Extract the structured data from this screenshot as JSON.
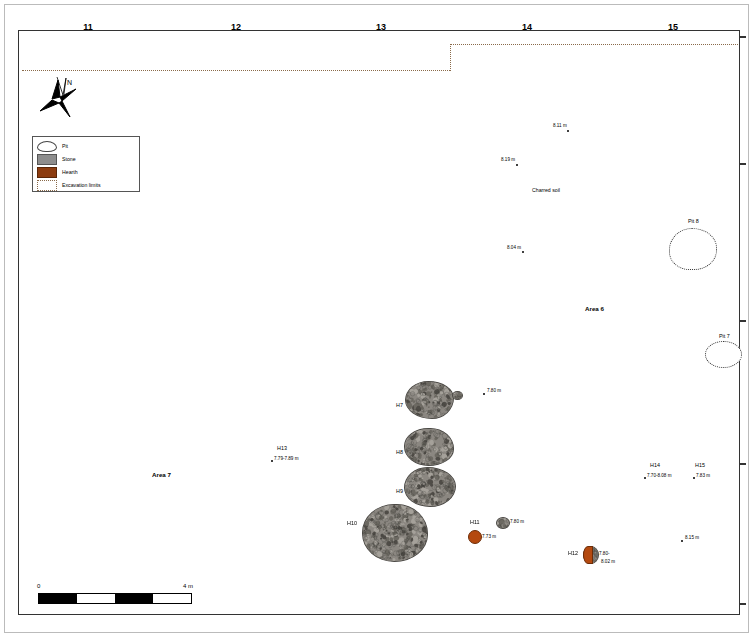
{
  "grid_labels": [
    {
      "label": "11",
      "x": 88
    },
    {
      "label": "12",
      "x": 236
    },
    {
      "label": "13",
      "x": 381
    },
    {
      "label": "14",
      "x": 527
    },
    {
      "label": "15",
      "x": 673
    }
  ],
  "legend": {
    "items": [
      {
        "key": "pit",
        "label": "Pit"
      },
      {
        "key": "stone",
        "label": "Stone"
      },
      {
        "key": "hearth",
        "label": "Hearth"
      },
      {
        "key": "excavation-limits",
        "label": "Excavation limits"
      }
    ]
  },
  "north_arrow": {
    "label": "N"
  },
  "areas": [
    {
      "label": "Area 6",
      "x": 585,
      "y": 308
    },
    {
      "label": "Area 7",
      "x": 152,
      "y": 474
    }
  ],
  "annotations": [
    {
      "label": "Charred soil",
      "x": 532,
      "y": 190
    }
  ],
  "features": [
    {
      "name": "H7",
      "label": "H7",
      "lx": 396,
      "ly": 404
    },
    {
      "name": "H8",
      "label": "H8",
      "lx": 396,
      "ly": 451
    },
    {
      "name": "H9",
      "label": "H9",
      "lx": 396,
      "ly": 490
    },
    {
      "name": "H10",
      "label": "H10",
      "lx": 348,
      "ly": 522
    },
    {
      "name": "H11",
      "label": "H11",
      "lx": 470,
      "ly": 521
    },
    {
      "name": "H12",
      "label": "H12",
      "lx": 570,
      "ly": 552
    },
    {
      "name": "H13",
      "label": "H13",
      "lx": 277,
      "ly": 447
    },
    {
      "name": "H14",
      "label": "H14",
      "lx": 650,
      "ly": 464
    },
    {
      "name": "H15",
      "label": "H15",
      "lx": 695,
      "ly": 464
    },
    {
      "name": "Pit 8",
      "label": "Pit 8",
      "lx": 688,
      "ly": 221
    },
    {
      "name": "Pit 7",
      "label": "Pit 7",
      "lx": 719,
      "ly": 336
    }
  ],
  "elevations": [
    {
      "value": "8.11 m",
      "x": 553,
      "y": 126,
      "dx": 567,
      "dy": 130
    },
    {
      "value": "8.19 m",
      "x": 501,
      "y": 160,
      "dx": 516,
      "dy": 164
    },
    {
      "value": "8.04 m",
      "x": 507,
      "y": 248,
      "dx": 522,
      "dy": 251
    },
    {
      "value": "7.80 m",
      "x": 485,
      "y": 390,
      "dx": 482,
      "dy": 394
    },
    {
      "value": "7.79-7.89 m",
      "x": 272,
      "y": 457,
      "dx": 270,
      "dy": 460
    },
    {
      "value": "7.70-8.08 m",
      "x": 645,
      "y": 474,
      "dx": 643,
      "dy": 478
    },
    {
      "value": "7.83 m",
      "x": 694,
      "y": 474,
      "dx": 692,
      "dy": 478
    },
    {
      "value": "8.15 m",
      "x": 683,
      "y": 537,
      "dx": 680,
      "dy": 541
    },
    {
      "value": "7.80 m",
      "x": 508,
      "y": 521,
      "dx": 505,
      "dy": 525
    },
    {
      "value": "7.73 m",
      "x": 480,
      "y": 535,
      "dx": 477,
      "dy": 538
    },
    {
      "value": "7.80-",
      "x": 597,
      "y": 554,
      "dx": 593,
      "dy": 557
    },
    {
      "value": "8.02 m",
      "x": 600,
      "y": 562,
      "dx": null,
      "dy": null
    },
    {
      "value": "7.49-",
      "x": 722,
      "y": 350,
      "dx": 718,
      "dy": 353
    },
    {
      "value": "7.86 m",
      "x": 721,
      "y": 357,
      "dx": null,
      "dy": null
    }
  ],
  "scale": {
    "min_label": "0",
    "max_label": "4 m",
    "segments": 4
  },
  "colors": {
    "stone": "#8b8781",
    "stone_outline": "#4c4a46",
    "hearth": "#b4490f",
    "excavation_limit": "#8a6a4a",
    "frame": "#333333"
  }
}
